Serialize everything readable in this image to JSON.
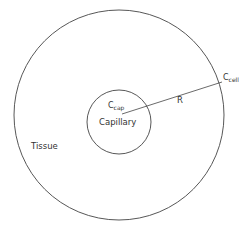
{
  "diagram": {
    "stroke_color": "#444444",
    "outer_circle": {
      "cx": 119,
      "cy": 115,
      "r": 105,
      "name": "tissue-boundary"
    },
    "inner_circle": {
      "cx": 119,
      "cy": 122,
      "r": 32,
      "name": "capillary-boundary"
    },
    "radius_line": {
      "x1": 122,
      "y1": 114,
      "x2": 222,
      "y2": 82
    },
    "labels": {
      "c_cap_main": "C",
      "c_cap_sub": "cap",
      "capillary": "Capillary",
      "radius": "R",
      "c_cell_main": "C",
      "c_cell_sub": "cell",
      "tissue": "Tissue"
    }
  }
}
